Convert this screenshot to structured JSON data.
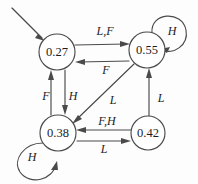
{
  "diagram": {
    "type": "state-transition-diagram",
    "nodes": [
      {
        "id": "n1",
        "label": "0.27",
        "cx": 57,
        "cy": 52,
        "r": 18
      },
      {
        "id": "n2",
        "label": "0.55",
        "cx": 147,
        "cy": 50,
        "r": 18
      },
      {
        "id": "n3",
        "label": "0.38",
        "cx": 58,
        "cy": 133,
        "r": 18
      },
      {
        "id": "n4",
        "label": "0.42",
        "cx": 148,
        "cy": 133,
        "r": 17
      }
    ],
    "edges": [
      {
        "id": "e1",
        "from": "n1",
        "to": "n2",
        "label": "L,F",
        "lx": 105,
        "ly": 31
      },
      {
        "id": "e2",
        "from": "n2",
        "to": "n1",
        "label": "F",
        "lx": 106,
        "ly": 70
      },
      {
        "id": "e3",
        "from": "n3",
        "to": "n1",
        "label": "F",
        "lx": 46,
        "ly": 96
      },
      {
        "id": "e4",
        "from": "n1",
        "to": "n3",
        "label": "H",
        "lx": 73,
        "ly": 96
      },
      {
        "id": "e5",
        "from": "n2",
        "to": "n3",
        "label": "L",
        "lx": 113,
        "ly": 100
      },
      {
        "id": "e6",
        "from": "n4",
        "to": "n2",
        "label": "L",
        "lx": 160,
        "ly": 98
      },
      {
        "id": "e7",
        "from": "n4",
        "to": "n3",
        "label": "F,H",
        "lx": 107,
        "ly": 122
      },
      {
        "id": "e8",
        "from": "n3",
        "to": "n4",
        "label": "L",
        "lx": 104,
        "ly": 148
      }
    ],
    "self_loops": [
      {
        "id": "s1",
        "node": "n2",
        "label": "H",
        "lx": 172,
        "ly": 32
      },
      {
        "id": "s2",
        "node": "n3",
        "label": "H",
        "lx": 32,
        "ly": 158
      }
    ],
    "start_arrow": {
      "id": "start",
      "from_x": 12,
      "from_y": 8,
      "to_x": 44,
      "to_y": 40
    },
    "colors": {
      "stroke": "#4a4a4a",
      "node_fill": "#ffffff",
      "text": "#1c1c1c",
      "background": "#fdfdfd"
    }
  }
}
